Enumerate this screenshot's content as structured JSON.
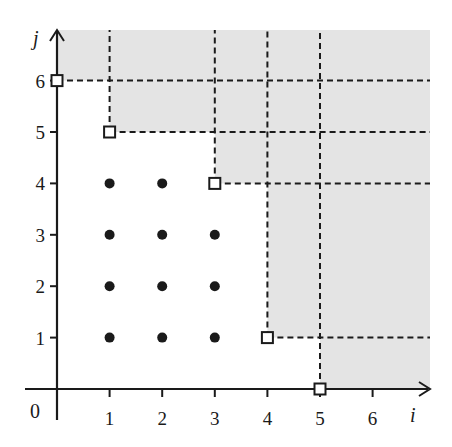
{
  "diagram": {
    "type": "lattice-staircase",
    "axes": {
      "x_label": "i",
      "y_label": "j",
      "origin_label": "0",
      "x_ticks": [
        "1",
        "2",
        "3",
        "4",
        "5",
        "6"
      ],
      "y_ticks": [
        "1",
        "2",
        "3",
        "4",
        "5",
        "6"
      ]
    },
    "corner_points": [
      {
        "i": 0,
        "j": 6
      },
      {
        "i": 1,
        "j": 5
      },
      {
        "i": 3,
        "j": 4
      },
      {
        "i": 4,
        "j": 1
      },
      {
        "i": 5,
        "j": 0
      }
    ],
    "interior_points": [
      {
        "i": 1,
        "j": 1
      },
      {
        "i": 2,
        "j": 1
      },
      {
        "i": 3,
        "j": 1
      },
      {
        "i": 1,
        "j": 2
      },
      {
        "i": 2,
        "j": 2
      },
      {
        "i": 3,
        "j": 2
      },
      {
        "i": 1,
        "j": 3
      },
      {
        "i": 2,
        "j": 3
      },
      {
        "i": 3,
        "j": 3
      },
      {
        "i": 1,
        "j": 4
      },
      {
        "i": 2,
        "j": 4
      }
    ],
    "colors": {
      "shade": "#e4e4e4",
      "ink": "#1a1a1a",
      "background": "#ffffff"
    }
  }
}
